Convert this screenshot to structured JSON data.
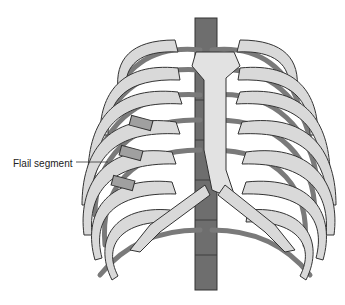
{
  "figure": {
    "labels": [
      {
        "text": "Flail segment",
        "target": "fractured ribs left side"
      }
    ]
  },
  "colors": {
    "rib_fill": "#d9d9d9",
    "rib_stroke": "#333333",
    "dark_rib": "#7a7a7a",
    "spine": "#6e6e6e",
    "sternum": "#e2e2e2",
    "background": "#ffffff"
  }
}
